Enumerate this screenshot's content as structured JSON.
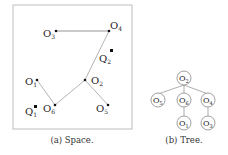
{
  "space": {
    "caption": "(a) Space.",
    "objects": [
      {
        "id": "O1",
        "base": "O",
        "sub": "1",
        "x": 40,
        "y": 80
      },
      {
        "id": "O2",
        "base": "O",
        "sub": "2",
        "x": 85,
        "y": 80
      },
      {
        "id": "O3",
        "base": "O",
        "sub": "3",
        "x": 56,
        "y": 31
      },
      {
        "id": "O4",
        "base": "O",
        "sub": "4",
        "x": 109,
        "y": 31
      },
      {
        "id": "O5",
        "base": "O",
        "sub": "5",
        "x": 108,
        "y": 105
      },
      {
        "id": "O6",
        "base": "O",
        "sub": "6",
        "x": 55,
        "y": 105
      }
    ],
    "queries": [
      {
        "id": "Q1",
        "base": "Q",
        "sub": "1",
        "x": 35,
        "y": 106
      },
      {
        "id": "Q2",
        "base": "Q",
        "sub": "2",
        "x": 111,
        "y": 51
      }
    ],
    "edges": [
      [
        "O3",
        "O4"
      ],
      [
        "O4",
        "O2"
      ],
      [
        "O2",
        "O6"
      ],
      [
        "O2",
        "O5"
      ],
      [
        "O6",
        "O1"
      ]
    ]
  },
  "tree": {
    "caption": "(b) Tree.",
    "nodes": [
      {
        "id": "O2",
        "sub": "2",
        "x": 184,
        "y": 79
      },
      {
        "id": "O5",
        "sub": "5",
        "x": 158,
        "y": 100
      },
      {
        "id": "O6",
        "sub": "6",
        "x": 184,
        "y": 100
      },
      {
        "id": "O4",
        "sub": "4",
        "x": 208,
        "y": 100
      },
      {
        "id": "O1",
        "sub": "1",
        "x": 184,
        "y": 123
      },
      {
        "id": "O3",
        "sub": "3",
        "x": 208,
        "y": 123
      }
    ],
    "edges": [
      [
        "O2",
        "O5"
      ],
      [
        "O2",
        "O6"
      ],
      [
        "O2",
        "O4"
      ],
      [
        "O6",
        "O1"
      ],
      [
        "O4",
        "O3"
      ]
    ]
  }
}
